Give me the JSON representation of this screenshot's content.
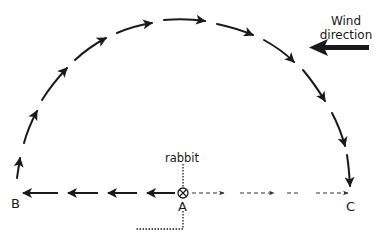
{
  "diagram": {
    "title": "",
    "colors": {
      "ink": "#1a1a1a",
      "background": "#ffffff"
    },
    "labels": {
      "wind_line1": "Wind",
      "wind_line2": "direction",
      "rabbit": "rabbit",
      "point_a": "A",
      "point_b": "B",
      "point_c": "C"
    },
    "elements": {
      "rabbit_marker": "circled-x-icon",
      "wind_arrow": "thick-left-arrow-icon",
      "arc_path": "semicircle of solid arrows from B over the top to C (clockwise)",
      "path_a_to_b": "solid arrows from A leftward to B",
      "path_a_to_c": "dashed arrows from A rightward to C"
    }
  }
}
